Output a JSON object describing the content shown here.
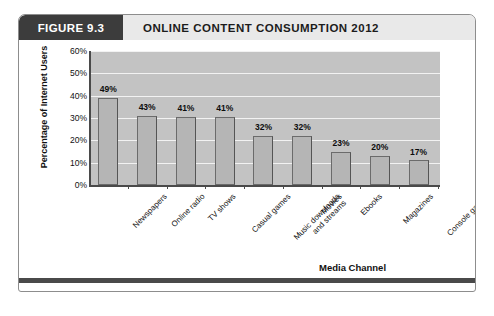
{
  "figure": {
    "number_label": "FIGURE 9.3",
    "title": "ONLINE CONTENT CONSUMPTION 2012"
  },
  "chart_data": {
    "type": "bar",
    "title": "ONLINE CONTENT CONSUMPTION 2012",
    "xlabel": "Media Channel",
    "ylabel": "Percentage of Internet Users",
    "ylim": [
      0,
      60
    ],
    "ytick_labels": [
      "60%",
      "50%",
      "40%",
      "30%",
      "20%",
      "10%",
      "0%"
    ],
    "ytick_values": [
      60,
      50,
      40,
      30,
      20,
      10,
      0
    ],
    "grid": true,
    "legend": "none",
    "categories": [
      "Newspapers",
      "Online radio",
      "TV shows",
      "Casual games",
      "Music downloads\nand streams",
      "Movies",
      "Ebooks",
      "Magazines",
      "Console games"
    ],
    "values": [
      49,
      43,
      41,
      41,
      32,
      32,
      23,
      20,
      17
    ],
    "data_labels": [
      "49%",
      "43%",
      "41%",
      "41%",
      "32%",
      "32%",
      "23%",
      "20%",
      "17%"
    ],
    "plotted_heights": [
      39,
      31,
      30.5,
      30.5,
      22,
      22,
      15,
      13,
      11
    ]
  },
  "colors": {
    "figure_number_bg": "#3c3c3c",
    "title_bar_bg": "#e9e9e9",
    "plot_bg": "#c3c3c3",
    "bar_fill": "#b5b5b5",
    "bar_stroke": "#6b6b6b",
    "gridline": "#f2f2f2",
    "axis": "#4a4a4a"
  }
}
